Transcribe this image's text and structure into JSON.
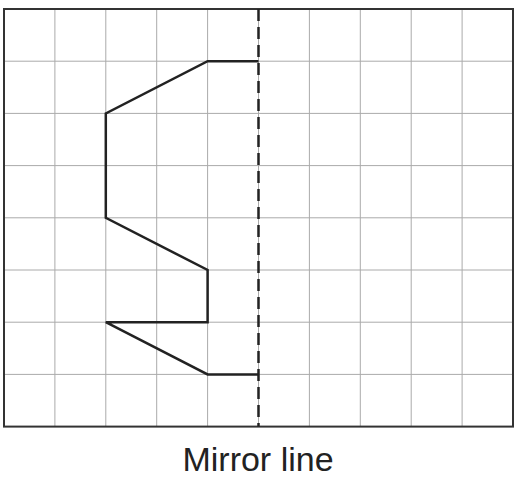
{
  "caption": "Mirror line",
  "grid": {
    "columns": 10,
    "rows": 8,
    "origin_x": 4,
    "origin_y": 9,
    "cell_w": 50.9,
    "cell_h": 52.2,
    "line_color": "#aaaaaa",
    "border_color": "#333333"
  },
  "mirror_line": {
    "column": 5,
    "style": "dashed",
    "color": "#222222"
  },
  "shape": {
    "color": "#222222",
    "points": [
      [
        5,
        1
      ],
      [
        4,
        1
      ],
      [
        2,
        2
      ],
      [
        2,
        4
      ],
      [
        4,
        5
      ],
      [
        4,
        6
      ],
      [
        2,
        6
      ],
      [
        4,
        7
      ],
      [
        5,
        7
      ]
    ]
  }
}
